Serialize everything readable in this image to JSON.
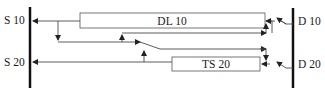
{
  "diagram": {
    "left_bus": {
      "labels": {
        "top": "S 10",
        "bottom": "S 20"
      }
    },
    "right_bus": {
      "labels": {
        "top": "D 10",
        "bottom": "D 20"
      }
    },
    "blocks": [
      {
        "id": "dl10",
        "label": "DL 10"
      },
      {
        "id": "ts20",
        "label": "TS 20"
      }
    ],
    "colors": {
      "line": "#4a4a4a",
      "bus": "#111111",
      "box_border": "#555555"
    }
  }
}
